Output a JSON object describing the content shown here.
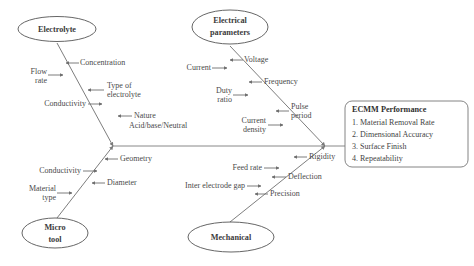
{
  "diagram": {
    "type": "fishbone-ishikawa",
    "categories": [
      {
        "id": "electrolyte",
        "label": "Electrolyte",
        "position": "top-left",
        "causes": [
          "Concentration",
          "Flow rate",
          "Type of electrolyte",
          "Conductivity",
          "Nature Acid/base/Neutral"
        ]
      },
      {
        "id": "electrical-parameters",
        "label_line1": "Electrical",
        "label_line2": "parameters",
        "position": "top-right",
        "causes": [
          "Voltage",
          "Current",
          "Frequency",
          "Duty ratio",
          "Pulse period",
          "Current density"
        ]
      },
      {
        "id": "micro-tool",
        "label_line1": "Micro",
        "label_line2": "tool",
        "position": "bottom-left",
        "causes": [
          "Geometry",
          "Conductivity",
          "Diameter",
          "Material type"
        ]
      },
      {
        "id": "mechanical",
        "label": "Mechanical",
        "position": "bottom-right",
        "causes": [
          "Rigidity",
          "Feed rate",
          "Deflection",
          "Inter electrode gap",
          "Precision"
        ]
      }
    ],
    "effect": {
      "title": "ECMM Performance",
      "items": [
        "1. Material Removal Rate",
        "2. Dimensional Accuracy",
        "3. Surface Finish",
        "4. Repeatability"
      ]
    },
    "causes": {
      "concentration": "Concentration",
      "flow_rate_l1": "Flow",
      "flow_rate_l2": "rate",
      "type_of_electrolyte_l1": "Type of",
      "type_of_electrolyte_l2": "electrolyte",
      "conductivity_electrolyte": "Conductivity",
      "nature_l1": "Nature",
      "nature_l2": "Acid/base/Neutral",
      "voltage": "Voltage",
      "current": "Current",
      "frequency": "Frequency",
      "duty_ratio_l1": "Duty",
      "duty_ratio_l2": "ratio",
      "pulse_period_l1": "Pulse",
      "pulse_period_l2": "period",
      "current_density_l1": "Current",
      "current_density_l2": "density",
      "geometry": "Geometry",
      "conductivity_tool": "Conductivity",
      "diameter": "Diameter",
      "material_type_l1": "Material",
      "material_type_l2": "type",
      "rigidity": "Rigidity",
      "feed_rate": "Feed rate",
      "deflection": "Deflection",
      "inter_electrode_gap": "Inter electrode gap",
      "precision": "Precision"
    },
    "colors": {
      "background": "#ffffff",
      "line": "#6e6e6e",
      "text": "#4a4a4a",
      "heading_text": "#2f2f2f",
      "ellipse_stroke": "#555555",
      "box_stroke": "#777777"
    }
  }
}
